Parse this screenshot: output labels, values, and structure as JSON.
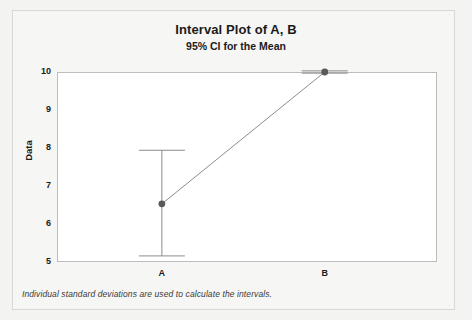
{
  "figure": {
    "title": "Interval Plot of A, B",
    "subtitle": "95% CI for the Mean",
    "footnote": "Individual standard deviations are used to calculate the intervals.",
    "background_color": "#f3f3f1",
    "panel_color": "#ffffff",
    "frame_color": "#d8d8d6",
    "axis_color": "#bdbdbd"
  },
  "chart_data": {
    "type": "scatter",
    "title": "Interval Plot of A, B",
    "subtitle": "95% CI for the Mean",
    "xlabel": "",
    "ylabel": "Data",
    "categories": [
      "A",
      "B"
    ],
    "ylim": [
      5,
      10
    ],
    "yticks": [
      5,
      6,
      7,
      8,
      9,
      10
    ],
    "ytick_labels": [
      "5",
      "6",
      "7",
      "8",
      "9",
      "10"
    ],
    "grid": false,
    "legend": null,
    "confidence_level": "95%",
    "marker_color": "#5a5a5a",
    "line_color": "#8c8c8c",
    "errorbar_color": "#8c8c8c",
    "series": [
      {
        "name": "Mean with 95% CI",
        "points": [
          {
            "category": "A",
            "mean": 6.53,
            "ci_lower": 5.16,
            "ci_upper": 7.94
          },
          {
            "category": "B",
            "mean": 10.0,
            "ci_lower": 9.97,
            "ci_upper": 10.03
          }
        ]
      }
    ],
    "annotations": [
      "Individual standard deviations are used to calculate the intervals."
    ]
  }
}
